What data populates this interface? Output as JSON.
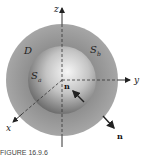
{
  "figure": {
    "labels": {
      "z_axis": "z",
      "y_axis": "y",
      "x_axis": "x",
      "region": "D",
      "outer_surface": "S",
      "outer_surface_sub": "b",
      "inner_surface": "S",
      "inner_surface_sub": "a",
      "normal_inner": "n",
      "normal_outer": "n"
    },
    "colors": {
      "outer_shell": "#9a9a9a",
      "inner_sphere_light": "#f4f4f4",
      "inner_sphere_dark": "#5a5a5a",
      "axes": "#333333",
      "background": "#ffffff"
    },
    "caption": "FIGURE 16.9.6"
  }
}
